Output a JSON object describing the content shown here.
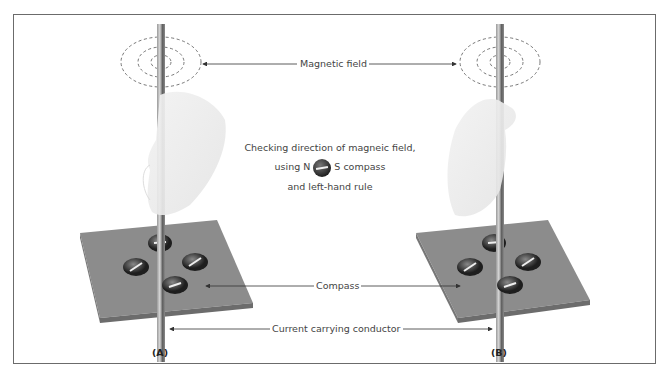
{
  "labels": {
    "magnetic_field": "Magnetic field",
    "compass": "Compass",
    "conductor": "Current carrying conductor"
  },
  "center_note": {
    "line1": "Checking direction of magneic field,",
    "line2_prefix": "using N",
    "line2_suffix": "S compass",
    "line3": "and left-hand rule"
  },
  "panels": {
    "a": "(A)",
    "b": "(B)"
  },
  "colors": {
    "plate": "#8a8a8a",
    "plate_edge": "#6c6c6c",
    "conductor": "#7a7a7a",
    "frame": "#6b6b6b",
    "text": "#444444"
  }
}
